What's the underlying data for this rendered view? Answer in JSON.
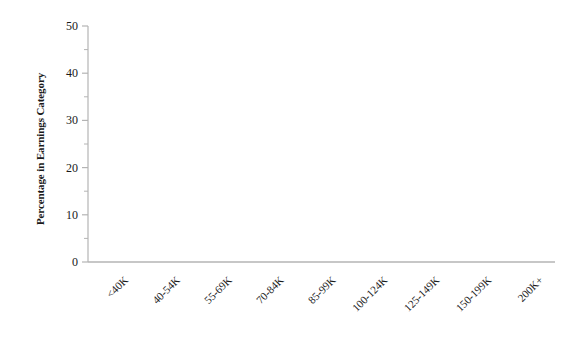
{
  "chart_data": {
    "type": "bar",
    "title": "",
    "subtitle": "",
    "xlabel": "",
    "ylabel": "Percentage in Earnings Category",
    "categories": [
      "<40K",
      "40-54K",
      "55-69K",
      "70-84K",
      "85-99K",
      "100-124K",
      "125-149K",
      "150-199K",
      "200K+"
    ],
    "values": [
      0,
      0,
      0,
      0,
      0,
      0,
      0,
      0,
      0
    ],
    "ylim": [
      0,
      50
    ],
    "xlim": [
      0,
      9
    ],
    "y_major_ticks": [
      0,
      10,
      20,
      30,
      40,
      50
    ],
    "y_minor_ticks": [
      5,
      15,
      25,
      35,
      45
    ],
    "y_tick_labels": [
      "0",
      "10",
      "20",
      "30",
      "40",
      "50"
    ],
    "grid": false,
    "legend": null,
    "legend_position": "none",
    "annotations": []
  },
  "style": {
    "background_color": "#ffffff",
    "axis_line_color": "#b4b4b4",
    "tick_color": "#b4b4b4",
    "text_color": "#1a1a1a"
  },
  "axes": {
    "y_title": "Percentage in Earnings Category",
    "spines": {
      "left": true,
      "bottom": true,
      "top": false,
      "right": false
    }
  }
}
